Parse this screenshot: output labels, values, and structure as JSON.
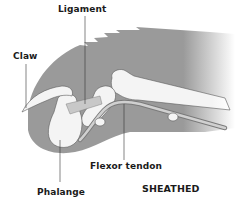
{
  "diagram": {
    "title": "SHEATHED",
    "labels": {
      "ligament": "Ligament",
      "claw": "Claw",
      "flexor_tendon": "Flexor tendon",
      "phalange": "Phalange",
      "state": "SHEATHED"
    },
    "colors": {
      "skin": "#9a9a9a",
      "bone": "#f4f4f4",
      "bone_outline": "#5a5a5a",
      "label_text": "#1a1a1a",
      "leader_line": "#333333",
      "background": "#ffffff"
    }
  }
}
